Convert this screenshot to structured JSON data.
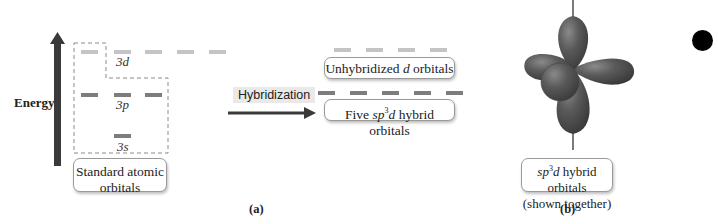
{
  "figure": {
    "panel_a": {
      "energy_axis": {
        "label": "Energy"
      },
      "atomic_orbitals": {
        "levels": [
          {
            "name": "3d",
            "prefix": "3",
            "letter": "d",
            "count": 5,
            "color": "#c4c4c4"
          },
          {
            "name": "3p",
            "prefix": "3",
            "letter": "p",
            "count": 3,
            "color": "#7d7d7d"
          },
          {
            "name": "3s",
            "prefix": "3",
            "letter": "s",
            "count": 1,
            "color": "#7d7d7d"
          }
        ],
        "box_label_line1": "Standard atomic",
        "box_label_line2": "orbitals"
      },
      "process": {
        "label": "Hybridization"
      },
      "hybrid_result": {
        "unhybridized": {
          "count": 4,
          "pre": "Unhybridized ",
          "italic": "d",
          "post": " orbitals",
          "color": "#c4c4c4"
        },
        "hybrid": {
          "count": 5,
          "pre": "Five ",
          "italic1": "sp",
          "sup": "3",
          "italic2": "d",
          "post": " hybrid orbitals",
          "color": "#7d7d7d"
        }
      },
      "caption": "(a)"
    },
    "panel_b": {
      "box_line1_italic1": "sp",
      "box_line1_sup": "3",
      "box_line1_italic2": "d",
      "box_line1_post": " hybrid orbitals",
      "box_line2": "(shown together)",
      "caption": "(b)",
      "lobe_color": "#5a5a5a"
    },
    "colors": {
      "arrow": "#3a3a3a",
      "dashed_box": "#8a8a8a",
      "dot": "#000000"
    }
  }
}
